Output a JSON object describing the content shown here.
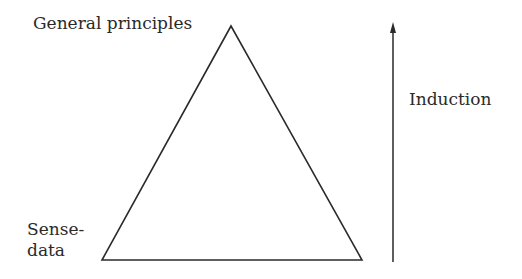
{
  "diagram": {
    "type": "triangle-with-arrow",
    "labels": {
      "apex": "General principles",
      "base_line1": "Sense-",
      "base_line2": "data",
      "arrow": "Induction"
    },
    "colors": {
      "stroke": "#2a2a2a",
      "background": "#ffffff"
    },
    "arrow_direction": "up"
  }
}
